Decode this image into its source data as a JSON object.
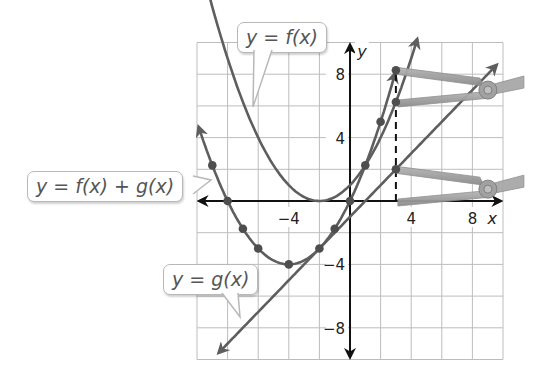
{
  "chart_data": {
    "type": "line",
    "title": "",
    "xlabel": "x",
    "ylabel": "y",
    "xlim": [
      -10,
      10
    ],
    "ylim": [
      -10,
      10
    ],
    "grid": true,
    "grid_step": 2,
    "x_tick_labels": [
      {
        "value": -4,
        "label": "−4"
      },
      {
        "value": 4,
        "label": "4"
      },
      {
        "value": 8,
        "label": "8"
      }
    ],
    "y_tick_labels": [
      {
        "value": 8,
        "label": "8"
      },
      {
        "value": 4,
        "label": "4"
      },
      {
        "value": -4,
        "label": "−4"
      },
      {
        "value": -8,
        "label": "−8"
      }
    ],
    "series": [
      {
        "name": "y = f(x)",
        "formula": "f(x) = 0.25(x+2)^2",
        "x_range": [
          -9.6,
          4.4
        ],
        "color": "#666666",
        "points": []
      },
      {
        "name": "y = g(x)",
        "formula": "g(x) = x - 1",
        "x_range": [
          -8.6,
          9.6
        ],
        "color": "#666666",
        "points": [
          {
            "x": 3,
            "y": 2
          }
        ]
      },
      {
        "name": "y = f(x) + g(x)",
        "formula": "f(x)+g(x) = 0.25x^2 + 2x",
        "x_range": [
          -9.9,
          2.95
        ],
        "color": "#555555",
        "points": [
          {
            "x": -9,
            "y": 2.25
          },
          {
            "x": -8,
            "y": 0
          },
          {
            "x": -7,
            "y": -1.75
          },
          {
            "x": -6,
            "y": -3
          },
          {
            "x": -4,
            "y": -4
          },
          {
            "x": -2,
            "y": -3
          },
          {
            "x": -1,
            "y": -1.75
          },
          {
            "x": 0,
            "y": 0
          },
          {
            "x": 1,
            "y": 2.25
          },
          {
            "x": 2,
            "y": 5
          },
          {
            "x": 3,
            "y": 8.25
          }
        ]
      }
    ],
    "annotations": [
      {
        "type": "dashed_vertical",
        "x": 3,
        "y_from": 0,
        "y_to": 8.25
      },
      {
        "type": "point",
        "on": "y = f(x)",
        "x": 3,
        "y": 6.25
      },
      {
        "type": "clip_icon",
        "x": 3,
        "y": 8.25,
        "y2": 6.25
      },
      {
        "type": "clip_icon",
        "x": 3,
        "y": 2,
        "y2": 0
      }
    ]
  },
  "labels": {
    "f": "y = f(x)",
    "g": "y = g(x)",
    "sum": "y = f(x) + g(x)",
    "x_axis": "x",
    "y_axis": "y"
  },
  "colors": {
    "grid": "#bdbdbd",
    "axis": "#111111",
    "curve": "#5e5e5e",
    "dot": "#4e4e4e",
    "clip": "#9a9a9a"
  }
}
